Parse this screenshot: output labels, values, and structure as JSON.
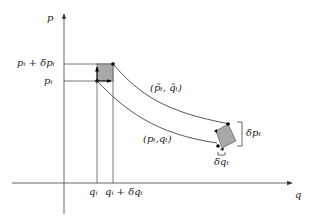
{
  "diagram": {
    "type": "phase-space flow",
    "axes": {
      "x_label": "q",
      "y_label": "p"
    },
    "labels": {
      "p_i_plus": "pᵢ + δpᵢ",
      "p_i": "pᵢ",
      "q_i": "qᵢ",
      "q_i_plus": "qᵢ + δqᵢ",
      "traj_upper": "(p̃ₜ, q̃ₜ)",
      "traj_lower": "(pₜ,qₜ)",
      "delta_p_t": "δpₜ",
      "delta_q_t": "δqₜ"
    },
    "colors": {
      "line": "#333333",
      "fill": "#a8a8a8",
      "point": "#000000"
    }
  }
}
